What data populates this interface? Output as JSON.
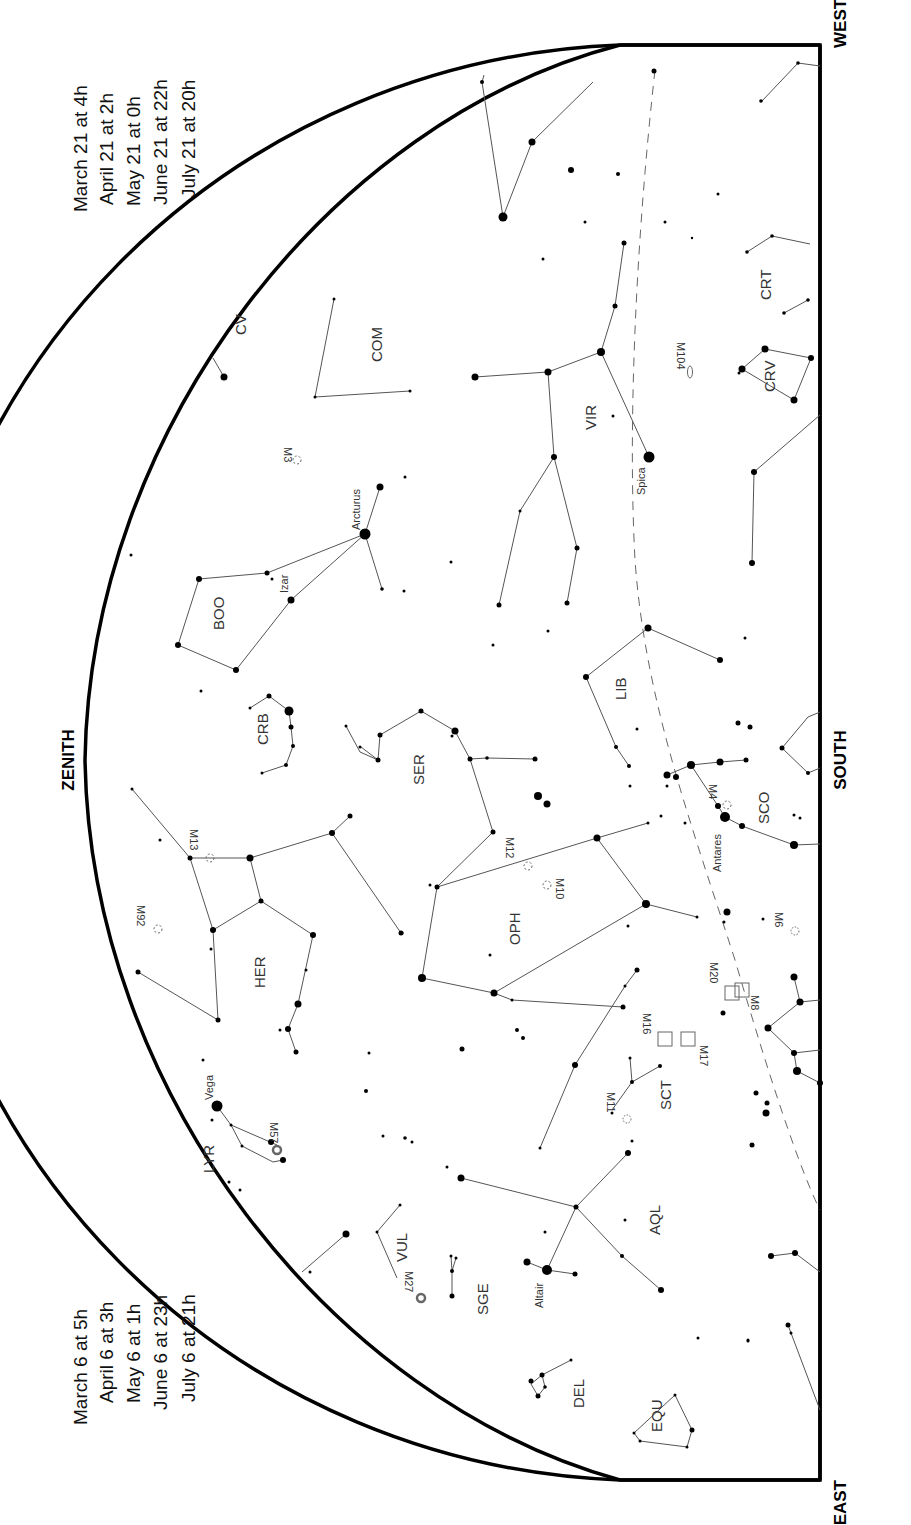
{
  "directions": {
    "zenith": "ZENITH",
    "west": "WEST",
    "south": "SOUTH",
    "east": "EAST"
  },
  "time_tables": {
    "left": [
      "March 6 at   5h",
      "April 6 at   3h",
      "May 6 at   1h",
      "June 6 at 23h",
      "July 6 at 21h"
    ],
    "right": [
      "March 21 at   4h",
      "April 21 at   2h",
      "May 21 at   0h",
      "June 21 at 22h",
      "July 21 at 20h"
    ]
  },
  "constellations": {
    "com": "COM",
    "vir": "VIR",
    "crt": "CRT",
    "crv": "CRV",
    "boo": "BOO",
    "crb": "CRB",
    "ser": "SER",
    "lib": "LIB",
    "sco": "SCO",
    "her": "HER",
    "oph": "OPH",
    "sct": "SCT",
    "aql": "AQL",
    "vul": "VUL",
    "sge": "SGE",
    "del": "DEL",
    "equ": "EQU",
    "lyr": "LYR",
    "cvn": "CV"
  },
  "stars": {
    "arcturus": "Arcturus",
    "izar": "Izar",
    "spica": "Spica",
    "antares": "Antares",
    "vega": "Vega",
    "altair": "Altair"
  },
  "deep_sky": {
    "m3": "M3",
    "m104": "M104",
    "m13": "M13",
    "m92": "M92",
    "m12": "M12",
    "m10": "M10",
    "m4": "M4",
    "m6": "M6",
    "m8": "M8",
    "m20": "M20",
    "m16": "M16",
    "m17": "M17",
    "m11": "M11",
    "m57": "M57",
    "m27": "M27"
  },
  "colors": {
    "ink": "#000000",
    "lines": "#555555",
    "labels": "#333333",
    "background": "#ffffff"
  }
}
